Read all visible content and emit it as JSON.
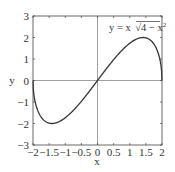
{
  "chart_data": {
    "type": "line",
    "title": "",
    "xlabel": "x",
    "ylabel": "y",
    "xlim": [
      -2,
      2
    ],
    "ylim": [
      -3,
      3
    ],
    "grid": false,
    "xticks": [
      "−2",
      "−1.5",
      "−1",
      "−0.5",
      "0",
      "0.5",
      "1",
      "1.5",
      "2"
    ],
    "xtick_values": [
      -2,
      -1.5,
      -1,
      -0.5,
      0,
      0.5,
      1,
      1.5,
      2
    ],
    "yticks": [
      "−3",
      "−2",
      "−1",
      "0",
      "1",
      "2",
      "3"
    ],
    "ytick_values": [
      -3,
      -2,
      -1,
      0,
      1,
      2,
      3
    ],
    "series": [
      {
        "name": "y = x√(4 − x²)",
        "x": [
          -2,
          -1.9,
          -1.75,
          -1.5,
          -1.414,
          -1.25,
          -1,
          -0.5,
          0,
          0.5,
          1,
          1.25,
          1.414,
          1.5,
          1.75,
          1.9,
          2
        ],
        "y": [
          0,
          -1.19,
          -1.69,
          -1.98,
          -2,
          -1.95,
          -1.73,
          -0.97,
          0,
          0.97,
          1.73,
          1.95,
          2,
          1.98,
          1.69,
          1.19,
          0
        ]
      }
    ],
    "annotation": {
      "text_prefix": "y = x",
      "text_radicand": "4 − x",
      "text_exponent": "2",
      "position": "upper right"
    },
    "axes_lines": {
      "x_zero": true,
      "y_zero": true
    }
  }
}
